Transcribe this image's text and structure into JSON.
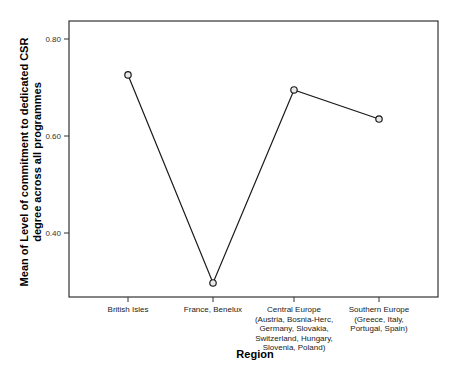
{
  "chart_data": {
    "type": "line",
    "title": "",
    "xlabel": "Region",
    "ylabel": "Mean of Level of commitment to dedicated CSR degree across all programmes",
    "ylabel_lines": [
      "Mean of Level of commitment to dedicated CSR",
      "degree across all programmes"
    ],
    "categories": [
      "British Isles",
      "France, Benelux",
      "Central Europe (Austria, Bosnia-Herc, Germany, Slovakia, Switzerland, Hungary, Slovenia, Poland)",
      "Southern Europe (Greece, Italy, Portugal, Spain)"
    ],
    "category_label_lines": [
      [
        "British Isles"
      ],
      [
        "France, Benelux"
      ],
      [
        "Central Europe",
        "(Austria, Bosnia-Herc,",
        "Germany, Slovakia,",
        "Switzerland, Hungary,",
        "Slovenia, Poland)"
      ],
      [
        "Southern Europe",
        "(Greece, Italy,",
        "Portugal, Spain)"
      ]
    ],
    "series": [
      {
        "name": "Mean",
        "values": [
          0.726,
          0.297,
          0.695,
          0.635
        ]
      }
    ],
    "yticks": [
      0.4,
      0.6,
      0.8
    ],
    "ytick_labels": [
      "0.40",
      "0.60",
      "0.80"
    ],
    "ylim": [
      0.29,
      0.83
    ],
    "grid": false,
    "legend": "none",
    "colors": {
      "line": "#1a1a1a",
      "marker_fill": "#e8e8e8",
      "frame": "#333333",
      "plot_bg": "#ffffff"
    }
  }
}
